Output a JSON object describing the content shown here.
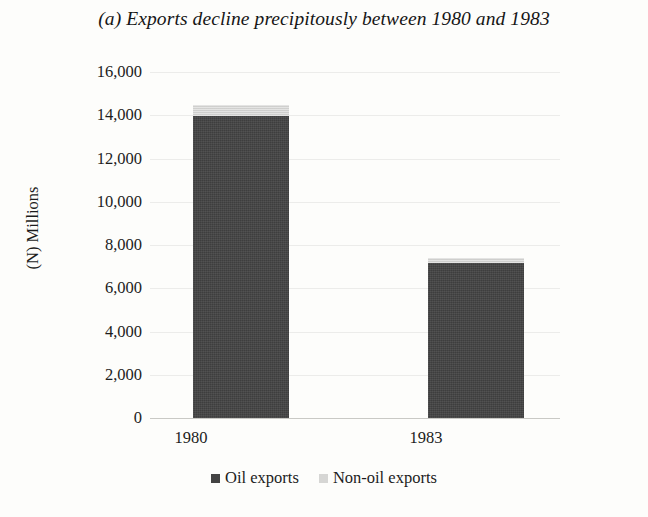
{
  "chart_data": {
    "type": "bar",
    "title": "(a) Exports decline precipitously between 1980 and 1983",
    "xlabel": "",
    "ylabel": "(N) Millions",
    "categories": [
      "1980",
      "1983"
    ],
    "stacked": true,
    "series": [
      {
        "name": "Oil exports",
        "color": "#434343",
        "values": [
          13980,
          7170
        ]
      },
      {
        "name": "Non-oil exports",
        "color": "#d6d6d4",
        "values": [
          510,
          230
        ]
      }
    ],
    "totals": [
      14490,
      7400
    ],
    "ylim": [
      0,
      16000
    ],
    "ytick_values": [
      16000,
      14000,
      12000,
      10000,
      8000,
      6000,
      4000,
      2000,
      0
    ],
    "ytick_labels": [
      "16,000",
      "14,000",
      "12,000",
      "10,000",
      "8,000",
      "6,000",
      "4,000",
      "2,000",
      "0"
    ],
    "grid": true,
    "legend_position": "bottom"
  },
  "legend": {
    "items": [
      {
        "label": "Oil exports",
        "color": "#434343"
      },
      {
        "label": "Non-oil exports",
        "color": "#d6d6d4"
      }
    ]
  }
}
